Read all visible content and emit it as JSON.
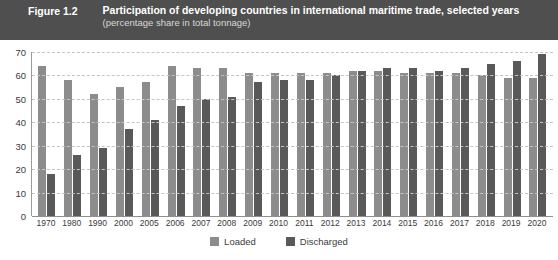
{
  "header": {
    "figure_number": "Figure 1.2",
    "title": "Participation of developing countries in international maritime trade, selected years",
    "subtitle": "(percentage share in total tonnage)",
    "band_color": "#4f4f4f"
  },
  "legend": {
    "position": "bottom-center",
    "items": [
      {
        "label": "Loaded",
        "color": "#8c8c8c"
      },
      {
        "label": "Discharged",
        "color": "#595959"
      }
    ]
  },
  "chart_data": {
    "type": "bar",
    "title": "Participation of developing countries in international maritime trade, selected years",
    "subtitle": "(percentage share in total tonnage)",
    "xlabel": "",
    "ylabel": "",
    "ylim": [
      0,
      70
    ],
    "yticks": [
      0,
      10,
      20,
      30,
      40,
      50,
      60,
      70
    ],
    "grid": true,
    "legend_position": "bottom-center",
    "categories": [
      "1970",
      "1980",
      "1990",
      "2000",
      "2005",
      "2006",
      "2007",
      "2008",
      "2009",
      "2010",
      "2011",
      "2012",
      "2013",
      "2014",
      "2015",
      "2016",
      "2017",
      "2018",
      "2019",
      "2020"
    ],
    "series": [
      {
        "name": "Loaded",
        "color": "#8c8c8c",
        "values": [
          64,
          58,
          52,
          55,
          57,
          64,
          63,
          63,
          61,
          61,
          61,
          61,
          62,
          62,
          61,
          61,
          61,
          60,
          59,
          59
        ]
      },
      {
        "name": "Discharged",
        "color": "#595959",
        "values": [
          18,
          26,
          29,
          37,
          41,
          47,
          50,
          51,
          57,
          58,
          58,
          60,
          62,
          63,
          63,
          62,
          63,
          65,
          66,
          69
        ]
      }
    ]
  }
}
